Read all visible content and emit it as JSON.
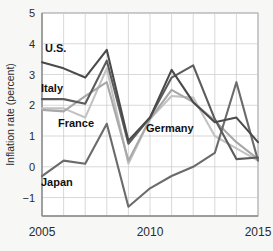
{
  "chart_data": {
    "type": "line",
    "title": "",
    "xlabel": "",
    "ylabel": "Inflation rate (percent)",
    "xlim": [
      2005,
      2015
    ],
    "ylim": [
      -1.6,
      5
    ],
    "xticks": [
      2005,
      2010,
      2015
    ],
    "xticklabels": [
      "2005",
      "2010",
      "2015"
    ],
    "yticks": [
      -1,
      0,
      1,
      2,
      3,
      4,
      5
    ],
    "yticklabels": [
      "−1",
      "0",
      "1",
      "2",
      "3",
      "4",
      "5"
    ],
    "grid": true,
    "legend_position": "inline-labels",
    "x": [
      2005,
      2006,
      2007,
      2008,
      2009,
      2010,
      2011,
      2012,
      2013,
      2014,
      2015
    ],
    "series": [
      {
        "name": "U.S.",
        "color": "#4a4a4a",
        "values": [
          3.4,
          3.2,
          2.9,
          3.8,
          0.85,
          1.6,
          3.15,
          2.1,
          1.45,
          1.6,
          0.8
        ]
      },
      {
        "name": "Italy",
        "color": "#5c5c5c",
        "values": [
          2.2,
          2.2,
          2.05,
          3.45,
          0.75,
          1.6,
          2.9,
          3.3,
          1.55,
          0.25,
          0.3
        ]
      },
      {
        "name": "France",
        "color": "#c2c2c2",
        "values": [
          1.9,
          1.9,
          1.6,
          3.2,
          0.1,
          1.55,
          2.3,
          2.25,
          1.0,
          0.6,
          0.2
        ]
      },
      {
        "name": "Germany",
        "color": "#a8a8a8",
        "values": [
          1.85,
          1.8,
          2.3,
          2.75,
          0.2,
          1.55,
          2.5,
          2.1,
          1.5,
          0.8,
          0.25
        ]
      },
      {
        "name": "Japan",
        "color": "#6b6b6b",
        "values": [
          -0.3,
          0.2,
          0.1,
          1.4,
          -1.3,
          -0.7,
          -0.3,
          0.0,
          0.45,
          2.75,
          0.2
        ]
      }
    ],
    "series_labels": [
      {
        "name": "U.S.",
        "text": "U.S.",
        "x_px": 45,
        "y_px": 52
      },
      {
        "name": "Italy",
        "text": "Italy",
        "x_px": 41,
        "y_px": 92
      },
      {
        "name": "France",
        "text": "France",
        "x_px": 58,
        "y_px": 127
      },
      {
        "name": "Germany",
        "text": "Germany",
        "x_px": 146,
        "y_px": 132
      },
      {
        "name": "Japan",
        "text": "Japan",
        "x_px": 41,
        "y_px": 186
      }
    ],
    "colors": {
      "background": "#f7f7f5",
      "plot_background": "#ffffff",
      "grid": "#c9c9cc",
      "axis": "#8d8d8d",
      "text": "#2b2b2b"
    }
  }
}
